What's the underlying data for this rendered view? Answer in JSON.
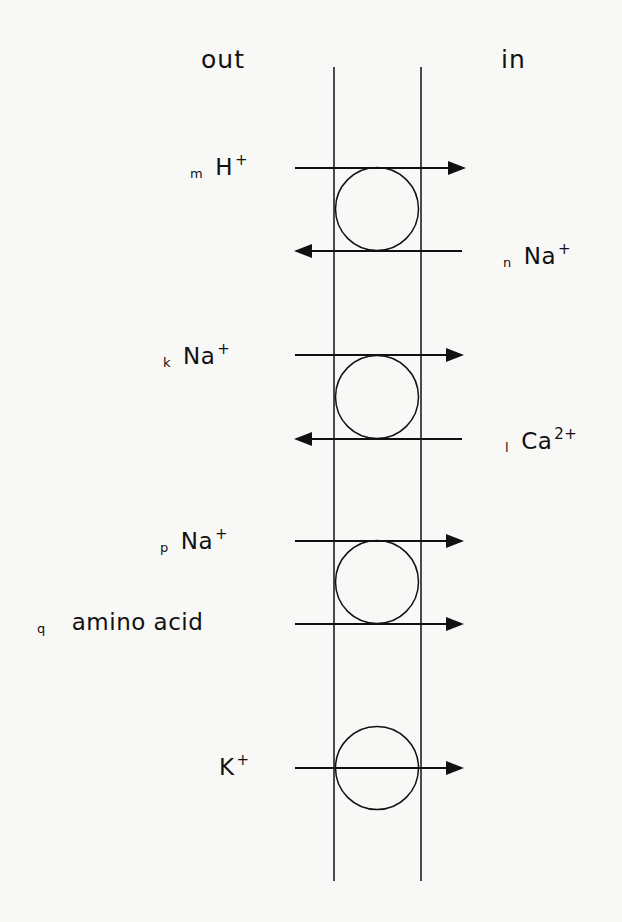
{
  "sides": {
    "outside": "out",
    "inside": "in"
  },
  "membrane": {
    "left_x": 334,
    "right_x": 421,
    "top_y": 67,
    "bottom_y": 881
  },
  "transporters": [
    {
      "type": "antiporter",
      "center_y": 209,
      "fluxes": [
        {
          "coefficient": "m",
          "species": "H",
          "charge": "+",
          "side": "out",
          "direction": "in",
          "y": 168
        },
        {
          "coefficient": "n",
          "species": "Na",
          "charge": "+",
          "side": "in",
          "direction": "out",
          "y": 251
        }
      ]
    },
    {
      "type": "antiporter",
      "center_y": 397,
      "fluxes": [
        {
          "coefficient": "k",
          "species": "Na",
          "charge": "+",
          "side": "out",
          "direction": "in",
          "y": 355
        },
        {
          "coefficient": "l",
          "species": "Ca",
          "charge": "2+",
          "side": "in",
          "direction": "out",
          "y": 439
        }
      ]
    },
    {
      "type": "symporter",
      "center_y": 582,
      "fluxes": [
        {
          "coefficient": "p",
          "species": "Na",
          "charge": "+",
          "side": "out",
          "direction": "in",
          "y": 541
        },
        {
          "coefficient": "q",
          "species": "amino acid",
          "charge": "",
          "side": "out",
          "direction": "in",
          "y": 624
        }
      ]
    },
    {
      "type": "uniporter",
      "center_y": 768,
      "fluxes": [
        {
          "coefficient": "",
          "species": "K",
          "charge": "+",
          "side": "out",
          "direction": "in",
          "y": 768
        }
      ]
    }
  ],
  "colors": {
    "ink": "#111111",
    "paper": "#f8f8f6"
  }
}
